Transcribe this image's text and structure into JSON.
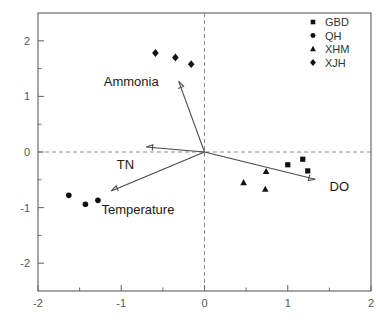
{
  "chart_data": {
    "type": "scatter",
    "title": "",
    "xlabel": "",
    "ylabel": "",
    "xlim": [
      -2,
      2
    ],
    "ylim": [
      -2.5,
      2.5
    ],
    "grid": false,
    "zero_reference_lines": true,
    "legend_position": "top-right",
    "x_ticks": [
      "-2",
      "-1",
      "0",
      "1",
      "2"
    ],
    "x_tick_values": [
      -2,
      -1,
      0,
      1,
      2
    ],
    "y_ticks": [
      "2",
      "1",
      "0",
      "-1",
      "-2"
    ],
    "y_tick_values": [
      2,
      1,
      0,
      -1,
      -2
    ],
    "x_minor_tick_values": [
      -1.5,
      -0.5,
      0.5,
      1.5
    ],
    "y_minor_tick_values": [
      1.5,
      0.5,
      -0.5,
      -1.5
    ],
    "series": [
      {
        "name": "GBD",
        "marker": "square",
        "points": [
          {
            "x": 1.0,
            "y": -0.23
          },
          {
            "x": 1.18,
            "y": -0.13
          },
          {
            "x": 1.24,
            "y": -0.34
          }
        ]
      },
      {
        "name": "QH",
        "marker": "circle",
        "points": [
          {
            "x": -1.63,
            "y": -0.78
          },
          {
            "x": -1.43,
            "y": -0.94
          },
          {
            "x": -1.28,
            "y": -0.87
          }
        ]
      },
      {
        "name": "XHM",
        "marker": "triangle",
        "points": [
          {
            "x": 0.47,
            "y": -0.55
          },
          {
            "x": 0.74,
            "y": -0.35
          },
          {
            "x": 0.73,
            "y": -0.67
          }
        ]
      },
      {
        "name": "XJH",
        "marker": "diamond",
        "points": [
          {
            "x": -0.59,
            "y": 1.78
          },
          {
            "x": -0.35,
            "y": 1.7
          },
          {
            "x": -0.16,
            "y": 1.58
          }
        ]
      }
    ],
    "vectors": [
      {
        "label": "Ammonia",
        "x": -0.31,
        "y": 1.27,
        "label_x": -0.88,
        "label_y": 1.28,
        "label_anchor": "middle"
      },
      {
        "label": "TN",
        "x": -0.7,
        "y": 0.09,
        "label_x": -0.95,
        "label_y": -0.22,
        "label_anchor": "middle"
      },
      {
        "label": "Temperature",
        "x": -1.12,
        "y": -0.7,
        "label_x": -0.8,
        "label_y": -1.03,
        "label_anchor": "middle"
      },
      {
        "label": "DO",
        "x": 1.33,
        "y": -0.49,
        "label_x": 1.62,
        "label_y": -0.62,
        "label_anchor": "middle"
      }
    ]
  },
  "legend": {
    "entries": [
      {
        "label": "GBD",
        "marker": "square"
      },
      {
        "label": "QH",
        "marker": "circle"
      },
      {
        "label": "XHM",
        "marker": "triangle"
      },
      {
        "label": "XJH",
        "marker": "diamond"
      }
    ]
  },
  "colors": {
    "marker": "#111111",
    "axis": "#6b6b6b",
    "tick_text": "#555555",
    "vector": "#4a4a4a",
    "vector_text": "#1a1a1a",
    "background": "#ffffff"
  }
}
